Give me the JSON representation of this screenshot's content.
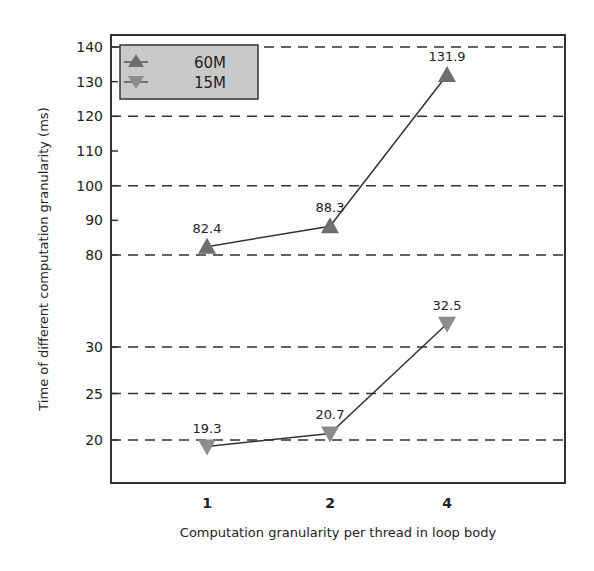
{
  "chart_data": {
    "type": "line",
    "title": "",
    "xlabel": "Computation granularity per thread in loop body",
    "ylabel": "Time of  different computation granularity (ms)",
    "categories": [
      "1",
      "2",
      "4"
    ],
    "series": [
      {
        "name": "60M",
        "values": [
          82.4,
          88.3,
          131.9
        ],
        "marker": "triangle-up",
        "color": "#6e6e6e"
      },
      {
        "name": "15M",
        "values": [
          19.3,
          20.7,
          32.5
        ],
        "marker": "triangle-down",
        "color": "#8c8c8c"
      }
    ],
    "y_axis": {
      "broken": true,
      "upper_segment": {
        "range": [
          80,
          140
        ],
        "ticks": [
          80,
          90,
          100,
          110,
          120,
          130,
          140
        ],
        "gridlines": [
          80,
          100,
          120,
          140
        ]
      },
      "lower_segment": {
        "range": [
          20,
          30
        ],
        "ticks": [
          20,
          25,
          30
        ],
        "gridlines": [
          20,
          25,
          30
        ]
      }
    },
    "grid": "horizontal-dashed",
    "legend_position": "top-left",
    "line_color": "#333333",
    "legend_bg": "#c9c9c9"
  }
}
